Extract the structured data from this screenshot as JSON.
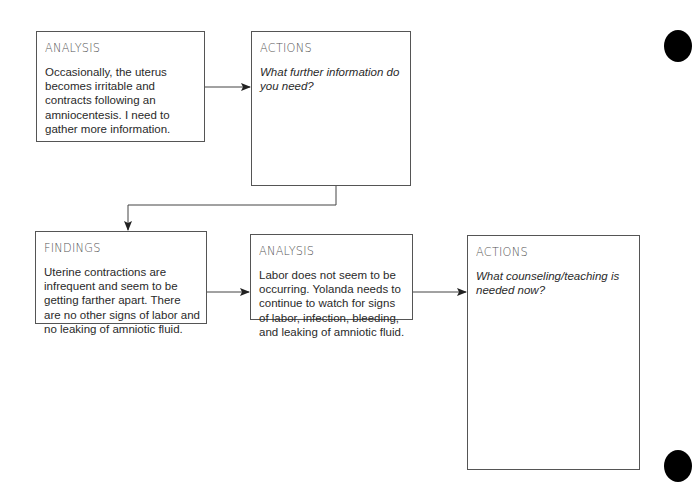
{
  "diagram": {
    "boxes": [
      {
        "id": "analysis-1",
        "title": "ANALYSIS",
        "body": "Occasionally, the uterus becomes irritable and contracts following an amniocentesis. I need to gather more information.",
        "italic": false
      },
      {
        "id": "actions-1",
        "title": "ACTIONS",
        "body": "What further information do you need?",
        "italic": true
      },
      {
        "id": "findings-1",
        "title": "FINDINGS",
        "body": "Uterine contractions are infrequent and seem to be getting farther apart. There are no other signs of labor and no leaking of amniotic fluid.",
        "italic": false
      },
      {
        "id": "analysis-2",
        "title": "ANALYSIS",
        "body": "Labor does not seem to be occurring. Yolanda needs to continue to watch for signs of labor, infection, bleeding, and leaking of amniotic fluid.",
        "italic": false
      },
      {
        "id": "actions-2",
        "title": "ACTIONS",
        "body": "What counseling/teaching is needed now?",
        "italic": true
      }
    ],
    "edges": [
      {
        "from": "analysis-1",
        "to": "actions-1"
      },
      {
        "from": "actions-1",
        "to": "findings-1"
      },
      {
        "from": "findings-1",
        "to": "analysis-2"
      },
      {
        "from": "analysis-2",
        "to": "actions-2"
      }
    ],
    "colors": {
      "border": "#555555",
      "line": "#444444",
      "title": "#555555",
      "text": "#2a2a2a"
    }
  }
}
